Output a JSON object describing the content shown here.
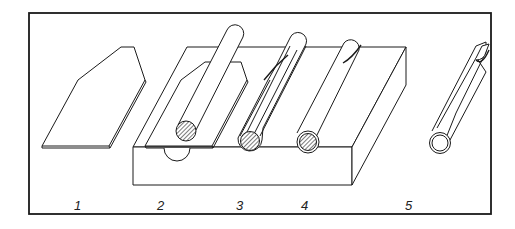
{
  "figure": {
    "labels": [
      "1",
      "2",
      "3",
      "4",
      "5"
    ],
    "colors": {
      "ink": "#1a1a1a",
      "background": "#ffffff",
      "hatch": "#555555"
    }
  }
}
